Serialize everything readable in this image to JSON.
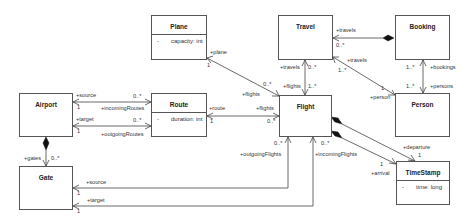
{
  "diagram": {
    "type": "UML class diagram",
    "classes": [
      {
        "name": "Plane",
        "attributes": [
          {
            "visibility": "-",
            "text": "capacity: int"
          }
        ]
      },
      {
        "name": "Travel",
        "attributes": []
      },
      {
        "name": "Booking",
        "attributes": []
      },
      {
        "name": "Airport",
        "attributes": []
      },
      {
        "name": "Route",
        "attributes": [
          {
            "visibility": "-",
            "text": "duration: int"
          }
        ]
      },
      {
        "name": "Flight",
        "attributes": []
      },
      {
        "name": "Person",
        "attributes": []
      },
      {
        "name": "Gate",
        "attributes": []
      },
      {
        "name": "TimeStamp",
        "attributes": [
          {
            "visibility": "-",
            "text": "time: long"
          }
        ]
      }
    ],
    "labels": {
      "plane_role": "+plane",
      "plane_mult": "1",
      "plane_flights_mult": "0..*",
      "plane_flights_role": "+flights",
      "travel_travels_role": "+travels",
      "travel_travels_mult": "0..*",
      "booking_travels_role": "+travels",
      "booking_travels_mult": "0..*",
      "travel_flights_role": "+flights",
      "travel_flights_mult": "1..*",
      "travel_person_travels_role": "+travels",
      "travel_person_travels_mult": "1..*",
      "person_role": "+person",
      "person_mult": "1",
      "bookings_mult": "1..*",
      "bookings_role": "+bookings",
      "persons_mult": "1..*",
      "persons_role": "+persons",
      "airport_source_role": "+source",
      "airport_source_mult": "1",
      "incoming_routes_mult": "0..*",
      "incoming_routes_role": "+incomingRoutes",
      "airport_target_role": "+target",
      "airport_target_mult": "1",
      "outgoing_routes_mult": "0..*",
      "outgoing_routes_role": "+outgoingRoutes",
      "route_role": "+route",
      "route_mult": "1",
      "route_flights_role": "+flights",
      "route_flights_mult": "0..*",
      "gates_role": "+gates",
      "gates_mult": "0..*",
      "gate_source_role": "+source",
      "gate_source_mult": "1",
      "gate_target_role": "+target",
      "gate_target_mult": "1",
      "outgoing_flights_mult": "0..*",
      "outgoing_flights_role": "+outgoingFlights",
      "incoming_flights_mult": "0..*",
      "incoming_flights_role": "+incomingFlights",
      "departure_role": "+departure",
      "departure_mult": "1",
      "arrival_mult": "1",
      "arrival_role": "+arrival"
    }
  }
}
